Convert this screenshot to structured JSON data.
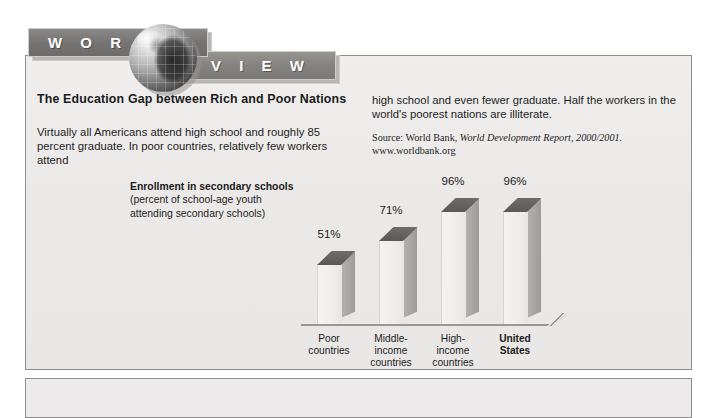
{
  "banner": {
    "word_left": "W O R L D",
    "word_right": "V I E W",
    "globe_icon": "globe-icon"
  },
  "article": {
    "headline": "The Education Gap between Rich and Poor Nations",
    "body_left": "Virtually all Americans attend high school and roughly 85 percent graduate. In poor countries, relatively few workers attend",
    "body_right": "high school and even fewer graduate. Half the workers in the world's poorest nations are illiterate.",
    "source_prefix": "Source: World Bank, ",
    "source_italic": "World Development Report, 2000/2001.",
    "source_url": "www.worldbank.org"
  },
  "chart_data": {
    "type": "bar",
    "title": "Enrollment in secondary schools",
    "subtitle_line1": "(percent of school-age youth",
    "subtitle_line2": "attending secondary schools)",
    "xlabel": "",
    "ylabel": "",
    "ylim": [
      0,
      100
    ],
    "grid": false,
    "legend": "none",
    "categories": [
      "Poor countries",
      "Middle-income countries",
      "High-income countries",
      "United States"
    ],
    "category_lines": [
      [
        "Poor",
        "countries"
      ],
      [
        "Middle-",
        "income",
        "countries"
      ],
      [
        "High-",
        "income",
        "countries"
      ],
      [
        "United",
        "States"
      ]
    ],
    "values": [
      51,
      71,
      96,
      96
    ],
    "value_labels": [
      "51%",
      "71%",
      "96%",
      "96%"
    ],
    "emphasis_index": 3
  },
  "colors": {
    "panel_bg": "#eceaea",
    "panel_border": "#8d8d8d",
    "banner_band": "#767472",
    "bar_top": "#63615f",
    "bar_side": "#a8a6a4",
    "bar_front": "#eeecea",
    "text": "#1c1c1c"
  }
}
